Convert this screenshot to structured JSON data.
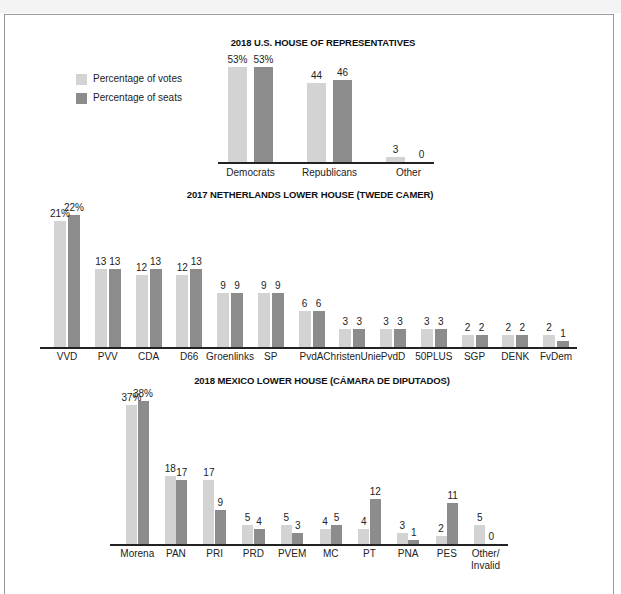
{
  "legend": {
    "votes_label": "Percentage of votes",
    "seats_label": "Percentage of seats",
    "votes_color": "#d3d3d3",
    "seats_color": "#8c8c8c"
  },
  "chart_data": [
    {
      "type": "bar",
      "title": "2018 U.S. HOUSE OF REPRESENTATIVES",
      "categories": [
        "Democrats",
        "Republicans",
        "Other"
      ],
      "series": [
        {
          "name": "Percentage of votes",
          "values": [
            53,
            44,
            3
          ]
        },
        {
          "name": "Percentage of seats",
          "values": [
            53,
            46,
            0
          ]
        }
      ],
      "value_labels": {
        "votes": [
          "53%",
          "44",
          "3"
        ],
        "seats": [
          "53%",
          "46",
          "0"
        ]
      },
      "xlabel": "",
      "ylabel": "",
      "grid": false,
      "legend_position": "left"
    },
    {
      "type": "bar",
      "title": "2017 NETHERLANDS LOWER HOUSE (TWEDE CAMER)",
      "categories": [
        "VVD",
        "PVV",
        "CDA",
        "D66",
        "Groenlinks",
        "SP",
        "PvdA",
        "ChristenUnie",
        "PvdD",
        "50PLUS",
        "SGP",
        "DENK",
        "FvDem"
      ],
      "series": [
        {
          "name": "Percentage of votes",
          "values": [
            21,
            13,
            12,
            12,
            9,
            9,
            6,
            3,
            3,
            3,
            2,
            2,
            2
          ]
        },
        {
          "name": "Percentage of seats",
          "values": [
            22,
            13,
            13,
            13,
            9,
            9,
            6,
            3,
            3,
            3,
            2,
            2,
            1
          ]
        }
      ],
      "value_labels": {
        "votes": [
          "21%",
          "13",
          "12",
          "12",
          "9",
          "9",
          "6",
          "3",
          "3",
          "3",
          "2",
          "2",
          "2"
        ],
        "seats": [
          "22%",
          "13",
          "13",
          "13",
          "9",
          "9",
          "6",
          "3",
          "3",
          "3",
          "2",
          "2",
          "1"
        ]
      },
      "xlabel": "",
      "ylabel": "",
      "grid": false
    },
    {
      "type": "bar",
      "title": "2018 MEXICO LOWER HOUSE (CÁMARA DE DIPUTADOS)",
      "categories": [
        "Morena",
        "PAN",
        "PRI",
        "PRD",
        "PVEM",
        "MC",
        "PT",
        "PNA",
        "PES",
        "Other/ Invalid"
      ],
      "series": [
        {
          "name": "Percentage of votes",
          "values": [
            37,
            18,
            17,
            5,
            5,
            4,
            4,
            3,
            2,
            5
          ]
        },
        {
          "name": "Percentage of seats",
          "values": [
            38,
            17,
            9,
            4,
            3,
            5,
            12,
            1,
            11,
            0
          ]
        }
      ],
      "value_labels": {
        "votes": [
          "37%",
          "18",
          "17",
          "5",
          "5",
          "4",
          "4",
          "3",
          "2",
          "5"
        ],
        "seats": [
          "38%",
          "17",
          "9",
          "4",
          "3",
          "5",
          "12",
          "1",
          "11",
          "0"
        ]
      },
      "xlabel": "",
      "ylabel": "",
      "grid": false
    }
  ]
}
